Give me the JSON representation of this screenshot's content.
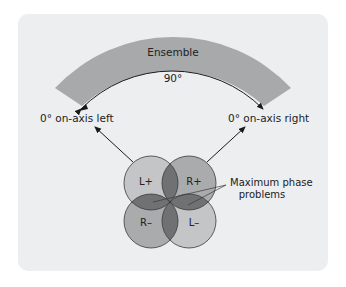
{
  "diagram": {
    "band_label": "Ensemble",
    "angle_label": "90°",
    "left_label": "0° on-axis left",
    "right_label": "0° on-axis right",
    "circles": [
      {
        "label": "L+",
        "fill": "#c3c5c6"
      },
      {
        "label": "R+",
        "fill": "#a9abad"
      },
      {
        "label": "R–",
        "fill": "#a9abad"
      },
      {
        "label": "L–",
        "fill": "#c3c5c6"
      }
    ],
    "callout_line1": "Maximum phase",
    "callout_line2": "problems",
    "colors": {
      "panel": "#eceef0",
      "band": "#a7a9ab",
      "overlap": "#6f7173",
      "line": "#1a1a1a"
    }
  }
}
